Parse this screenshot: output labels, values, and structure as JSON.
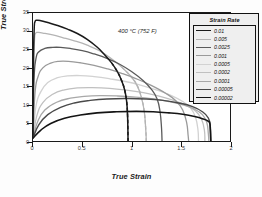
{
  "chart_data": {
    "type": "line",
    "title": "",
    "annotation": "400 °C (752 F)",
    "xlabel": "True Strain",
    "ylabel": "True Stress (Mpa)",
    "xlim": [
      0,
      2
    ],
    "ylim": [
      0,
      35
    ],
    "xticks": [
      "0",
      "0.5",
      "1",
      "1.5",
      "2"
    ],
    "xtick_values": [
      0,
      0.5,
      1,
      1.5,
      2
    ],
    "yticks": [
      "0",
      "5",
      "10",
      "15",
      "20",
      "25",
      "30",
      "35"
    ],
    "ytick_values": [
      0,
      5,
      10,
      15,
      20,
      25,
      30,
      35
    ],
    "grid": false,
    "legend_title": "Strain Rate",
    "legend_position": "top-right-inside",
    "series": [
      {
        "name": "0.01",
        "color": "#1a1a1a",
        "width": 1.5,
        "dashed_tail": true,
        "points": [
          [
            0.0,
            1.6
          ],
          [
            0.005,
            22.0
          ],
          [
            0.012,
            30.5
          ],
          [
            0.02,
            32.6
          ],
          [
            0.04,
            33.0
          ],
          [
            0.08,
            32.9
          ],
          [
            0.15,
            32.4
          ],
          [
            0.25,
            31.6
          ],
          [
            0.35,
            30.6
          ],
          [
            0.45,
            29.4
          ],
          [
            0.55,
            27.8
          ],
          [
            0.65,
            25.7
          ],
          [
            0.72,
            23.8
          ],
          [
            0.8,
            21.3
          ],
          [
            0.86,
            18.8
          ],
          [
            0.9,
            16.5
          ],
          [
            0.93,
            14.0
          ],
          [
            0.95,
            11.0
          ],
          [
            0.96,
            7.0
          ],
          [
            0.965,
            0.0
          ]
        ]
      },
      {
        "name": "0.005",
        "color": "#b4b4b4",
        "width": 1.3,
        "dashed_tail": true,
        "points": [
          [
            0.0,
            1.5
          ],
          [
            0.006,
            20.0
          ],
          [
            0.015,
            27.5
          ],
          [
            0.025,
            29.4
          ],
          [
            0.05,
            29.7
          ],
          [
            0.1,
            29.5
          ],
          [
            0.2,
            29.0
          ],
          [
            0.3,
            28.3
          ],
          [
            0.42,
            27.4
          ],
          [
            0.55,
            26.2
          ],
          [
            0.68,
            24.6
          ],
          [
            0.8,
            22.4
          ],
          [
            0.9,
            20.2
          ],
          [
            1.0,
            17.5
          ],
          [
            1.06,
            15.0
          ],
          [
            1.1,
            12.0
          ],
          [
            1.13,
            8.0
          ],
          [
            1.145,
            3.0
          ],
          [
            1.15,
            0.0
          ]
        ]
      },
      {
        "name": "0.0025",
        "color": "#5a5a5a",
        "width": 1.3,
        "dashed_tail": false,
        "points": [
          [
            0.0,
            1.4
          ],
          [
            0.01,
            16.5
          ],
          [
            0.03,
            22.5
          ],
          [
            0.06,
            24.4
          ],
          [
            0.12,
            25.3
          ],
          [
            0.2,
            25.6
          ],
          [
            0.28,
            25.6
          ],
          [
            0.38,
            25.3
          ],
          [
            0.5,
            24.7
          ],
          [
            0.62,
            23.8
          ],
          [
            0.75,
            22.6
          ],
          [
            0.88,
            21.0
          ],
          [
            1.0,
            19.0
          ],
          [
            1.12,
            16.5
          ],
          [
            1.2,
            14.2
          ],
          [
            1.26,
            11.5
          ],
          [
            1.29,
            8.0
          ],
          [
            1.305,
            3.5
          ],
          [
            1.31,
            0.0
          ]
        ]
      },
      {
        "name": "0.001",
        "color": "#9a9a9a",
        "width": 1.3,
        "dashed_tail": false,
        "points": [
          [
            0.0,
            1.3
          ],
          [
            0.02,
            13.0
          ],
          [
            0.05,
            17.5
          ],
          [
            0.1,
            20.0
          ],
          [
            0.18,
            21.3
          ],
          [
            0.26,
            21.8
          ],
          [
            0.36,
            21.8
          ],
          [
            0.48,
            21.4
          ],
          [
            0.62,
            20.7
          ],
          [
            0.76,
            19.7
          ],
          [
            0.9,
            18.5
          ],
          [
            1.05,
            17.0
          ],
          [
            1.2,
            15.2
          ],
          [
            1.35,
            13.0
          ],
          [
            1.45,
            11.0
          ],
          [
            1.52,
            8.5
          ],
          [
            1.56,
            5.0
          ],
          [
            1.575,
            1.5
          ],
          [
            1.58,
            0.0
          ]
        ]
      },
      {
        "name": "0.0005",
        "color": "#d2d2d2",
        "width": 1.3,
        "dashed_tail": false,
        "points": [
          [
            0.0,
            1.2
          ],
          [
            0.03,
            9.5
          ],
          [
            0.08,
            13.5
          ],
          [
            0.15,
            16.0
          ],
          [
            0.25,
            17.3
          ],
          [
            0.35,
            17.8
          ],
          [
            0.48,
            17.9
          ],
          [
            0.62,
            17.6
          ],
          [
            0.78,
            17.0
          ],
          [
            0.95,
            16.2
          ],
          [
            1.1,
            15.2
          ],
          [
            1.25,
            14.0
          ],
          [
            1.4,
            12.5
          ],
          [
            1.52,
            10.8
          ],
          [
            1.6,
            9.0
          ],
          [
            1.65,
            6.5
          ],
          [
            1.675,
            3.0
          ],
          [
            1.68,
            0.0
          ]
        ]
      },
      {
        "name": "0.0002",
        "color": "#c0c0c0",
        "width": 1.3,
        "dashed_tail": false,
        "points": [
          [
            0.0,
            1.1
          ],
          [
            0.04,
            7.0
          ],
          [
            0.1,
            10.5
          ],
          [
            0.2,
            12.8
          ],
          [
            0.32,
            14.0
          ],
          [
            0.45,
            14.5
          ],
          [
            0.6,
            14.6
          ],
          [
            0.78,
            14.4
          ],
          [
            0.95,
            13.9
          ],
          [
            1.12,
            13.2
          ],
          [
            1.28,
            12.3
          ],
          [
            1.42,
            11.2
          ],
          [
            1.55,
            9.8
          ],
          [
            1.65,
            8.2
          ],
          [
            1.71,
            6.0
          ],
          [
            1.74,
            3.0
          ],
          [
            1.745,
            0.0
          ]
        ]
      },
      {
        "name": "0.0001",
        "color": "#a8a8a8",
        "width": 1.3,
        "dashed_tail": false,
        "points": [
          [
            0.0,
            1.0
          ],
          [
            0.05,
            5.5
          ],
          [
            0.12,
            8.5
          ],
          [
            0.24,
            10.6
          ],
          [
            0.38,
            11.7
          ],
          [
            0.52,
            12.2
          ],
          [
            0.68,
            12.4
          ],
          [
            0.86,
            12.3
          ],
          [
            1.04,
            12.0
          ],
          [
            1.22,
            11.5
          ],
          [
            1.38,
            10.8
          ],
          [
            1.52,
            9.9
          ],
          [
            1.64,
            8.7
          ],
          [
            1.72,
            7.2
          ],
          [
            1.765,
            5.0
          ],
          [
            1.78,
            2.0
          ],
          [
            1.785,
            0.0
          ]
        ]
      },
      {
        "name": "0.00005",
        "color": "#4a4a4a",
        "width": 1.4,
        "dashed_tail": false,
        "points": [
          [
            0.0,
            0.9
          ],
          [
            0.06,
            4.5
          ],
          [
            0.15,
            7.2
          ],
          [
            0.28,
            9.2
          ],
          [
            0.42,
            10.4
          ],
          [
            0.58,
            11.1
          ],
          [
            0.75,
            11.5
          ],
          [
            0.95,
            11.6
          ],
          [
            1.15,
            11.5
          ],
          [
            1.32,
            11.1
          ],
          [
            1.48,
            10.4
          ],
          [
            1.62,
            9.4
          ],
          [
            1.72,
            8.0
          ],
          [
            1.78,
            6.3
          ],
          [
            1.8,
            4.0
          ],
          [
            1.805,
            0.0
          ]
        ]
      },
      {
        "name": "0.00002",
        "color": "#141414",
        "width": 1.6,
        "dashed_tail": false,
        "points": [
          [
            0.0,
            0.8
          ],
          [
            0.08,
            3.0
          ],
          [
            0.18,
            4.8
          ],
          [
            0.32,
            6.2
          ],
          [
            0.48,
            7.1
          ],
          [
            0.65,
            7.7
          ],
          [
            0.85,
            8.0
          ],
          [
            1.05,
            8.1
          ],
          [
            1.22,
            8.0
          ],
          [
            1.38,
            7.7
          ],
          [
            1.52,
            7.3
          ],
          [
            1.64,
            6.7
          ],
          [
            1.73,
            6.0
          ],
          [
            1.78,
            5.4
          ],
          [
            1.795,
            4.8
          ],
          [
            1.8,
            3.0
          ],
          [
            1.805,
            0.0
          ]
        ]
      }
    ]
  }
}
